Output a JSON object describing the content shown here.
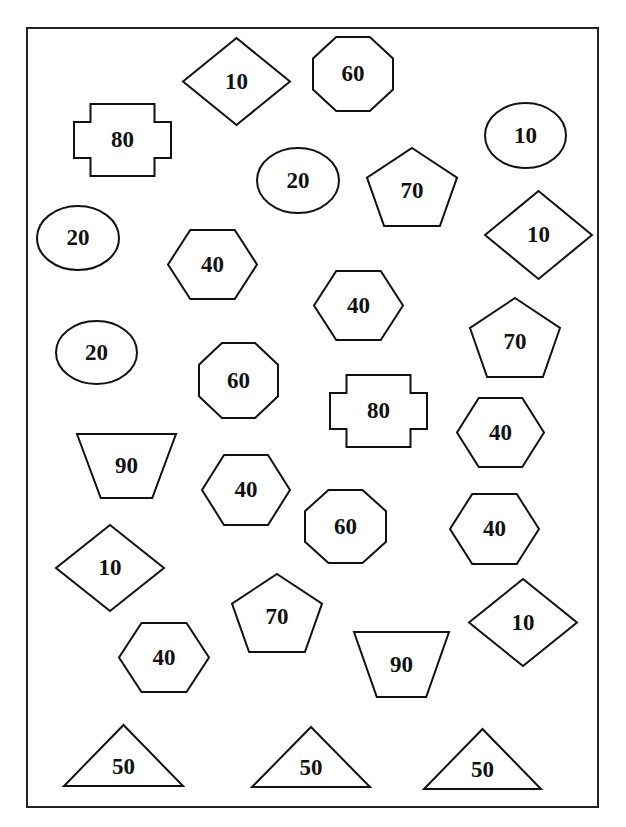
{
  "worksheet": {
    "stroke_color": "#111111",
    "background_color": "#ffffff",
    "shapes": [
      {
        "type": "diamond",
        "value": "10",
        "x": 183,
        "y": 38,
        "w": 107,
        "h": 87
      },
      {
        "type": "octagon",
        "value": "60",
        "x": 313,
        "y": 37,
        "w": 80,
        "h": 74
      },
      {
        "type": "cross",
        "value": "80",
        "x": 74,
        "y": 104,
        "w": 97,
        "h": 72
      },
      {
        "type": "ellipse",
        "value": "10",
        "x": 485,
        "y": 103,
        "w": 81,
        "h": 65
      },
      {
        "type": "ellipse",
        "value": "20",
        "x": 257,
        "y": 148,
        "w": 82,
        "h": 65
      },
      {
        "type": "pentagon",
        "value": "70",
        "x": 367,
        "y": 148,
        "w": 90,
        "h": 78
      },
      {
        "type": "ellipse",
        "value": "20",
        "x": 37,
        "y": 206,
        "w": 82,
        "h": 64
      },
      {
        "type": "diamond",
        "value": "10",
        "x": 485,
        "y": 191,
        "w": 107,
        "h": 88
      },
      {
        "type": "hexagon",
        "value": "40",
        "x": 168,
        "y": 230,
        "w": 89,
        "h": 69
      },
      {
        "type": "hexagon",
        "value": "40",
        "x": 314,
        "y": 271,
        "w": 89,
        "h": 69
      },
      {
        "type": "pentagon",
        "value": "70",
        "x": 470,
        "y": 298,
        "w": 90,
        "h": 79
      },
      {
        "type": "ellipse",
        "value": "20",
        "x": 56,
        "y": 321,
        "w": 81,
        "h": 63
      },
      {
        "type": "octagon",
        "value": "60",
        "x": 199,
        "y": 343,
        "w": 79,
        "h": 75
      },
      {
        "type": "cross",
        "value": "80",
        "x": 330,
        "y": 375,
        "w": 97,
        "h": 72
      },
      {
        "type": "hexagon",
        "value": "40",
        "x": 457,
        "y": 398,
        "w": 87,
        "h": 69
      },
      {
        "type": "trapezoid",
        "value": "90",
        "x": 77,
        "y": 434,
        "w": 99,
        "h": 64
      },
      {
        "type": "hexagon",
        "value": "40",
        "x": 202,
        "y": 455,
        "w": 88,
        "h": 70
      },
      {
        "type": "octagon",
        "value": "60",
        "x": 305,
        "y": 490,
        "w": 81,
        "h": 73
      },
      {
        "type": "hexagon",
        "value": "40",
        "x": 450,
        "y": 494,
        "w": 89,
        "h": 70
      },
      {
        "type": "diamond",
        "value": "10",
        "x": 56,
        "y": 525,
        "w": 108,
        "h": 86
      },
      {
        "type": "pentagon",
        "value": "70",
        "x": 232,
        "y": 574,
        "w": 90,
        "h": 78
      },
      {
        "type": "diamond",
        "value": "10",
        "x": 469,
        "y": 579,
        "w": 108,
        "h": 87
      },
      {
        "type": "hexagon",
        "value": "40",
        "x": 119,
        "y": 623,
        "w": 90,
        "h": 69
      },
      {
        "type": "trapezoid",
        "value": "90",
        "x": 354,
        "y": 632,
        "w": 95,
        "h": 65
      },
      {
        "type": "triangle",
        "value": "50",
        "x": 64,
        "y": 725,
        "w": 119,
        "h": 61
      },
      {
        "type": "triangle",
        "value": "50",
        "x": 252,
        "y": 727,
        "w": 118,
        "h": 60
      },
      {
        "type": "triangle",
        "value": "50",
        "x": 424,
        "y": 729,
        "w": 117,
        "h": 60
      }
    ]
  }
}
